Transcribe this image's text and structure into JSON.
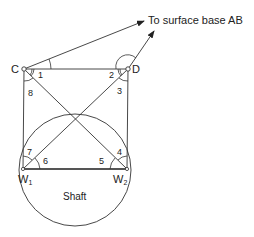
{
  "diagram": {
    "annotation": "To surface base AB",
    "points": {
      "C": {
        "label": "C"
      },
      "D": {
        "label": "D"
      },
      "W1": {
        "label": "W",
        "sub": "1"
      },
      "W2": {
        "label": "W",
        "sub": "2"
      }
    },
    "angles": [
      "1",
      "2",
      "3",
      "4",
      "5",
      "6",
      "7",
      "8"
    ],
    "shaft_label": "Shaft",
    "colors": {
      "line": "#333333",
      "background": "#ffffff"
    }
  }
}
